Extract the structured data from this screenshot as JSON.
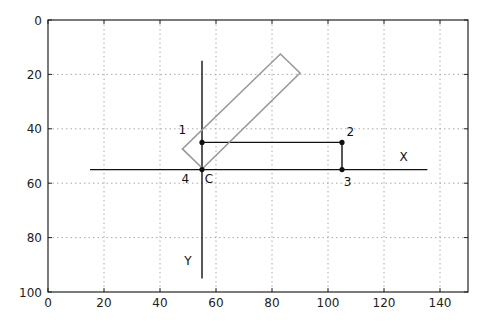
{
  "chart_data": {
    "type": "line",
    "title": "",
    "xlabel": "",
    "ylabel": "",
    "xlim": [
      0,
      150
    ],
    "ylim": [
      100,
      0
    ],
    "y_inverted": true,
    "grid": true,
    "x_ticks": [
      0,
      20,
      40,
      60,
      80,
      100,
      120,
      140
    ],
    "y_ticks": [
      0,
      20,
      40,
      60,
      80,
      100
    ],
    "series": [
      {
        "name": "X axis line",
        "color": "#111111",
        "x": [
          15,
          135.5
        ],
        "y": [
          55,
          55
        ]
      },
      {
        "name": "Y axis line",
        "color": "#111111",
        "x": [
          55,
          55
        ],
        "y": [
          15,
          95
        ]
      },
      {
        "name": "path 1-2-3",
        "color": "#111111",
        "x": [
          55,
          105,
          105
        ],
        "y": [
          45,
          45,
          55
        ]
      },
      {
        "name": "rotated rectangle",
        "color": "#999999",
        "x": [
          55.2,
          48,
          83,
          90,
          55.2
        ],
        "y": [
          54.6,
          47.4,
          12.5,
          19.5,
          54.6
        ]
      }
    ],
    "points": [
      {
        "label": "1",
        "x": 55,
        "y": 45
      },
      {
        "label": "2",
        "x": 105,
        "y": 45
      },
      {
        "label": "3",
        "x": 105,
        "y": 55
      },
      {
        "label": "4",
        "x": 55,
        "y": 55
      }
    ],
    "annotations": [
      {
        "text": "1",
        "x": 48,
        "y": 42
      },
      {
        "text": "2",
        "x": 108,
        "y": 42.5
      },
      {
        "text": "3",
        "x": 107,
        "y": 61
      },
      {
        "text": "4",
        "x": 49,
        "y": 60
      },
      {
        "text": "C",
        "x": 57.5,
        "y": 60
      },
      {
        "text": "X",
        "x": 127,
        "y": 52
      },
      {
        "text": "Y",
        "x": 50,
        "y": 90
      }
    ]
  }
}
